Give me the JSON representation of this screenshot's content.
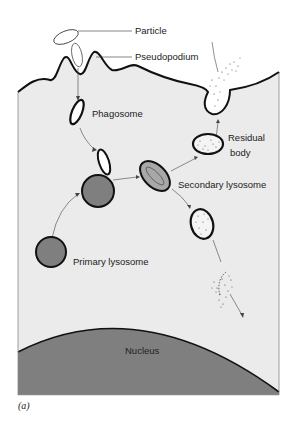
{
  "figure": {
    "caption": "(a)",
    "colors": {
      "cytoplasm": "#ebebeb",
      "nucleus": "#7f7f7f",
      "lysosome": "#8a8a8a",
      "secondary_lysosome": "#a8a8a8",
      "outline": "#111111",
      "background": "#ffffff"
    }
  },
  "labels": {
    "particle": "Particle",
    "pseudopodium": "Pseudopodium",
    "phagosome": "Phagosome",
    "residual_body_line1": "Residual",
    "residual_body_line2": "body",
    "secondary_lysosome": "Secondary lysosome",
    "primary_lysosome": "Primary lysosome",
    "nucleus": "Nucleus"
  }
}
